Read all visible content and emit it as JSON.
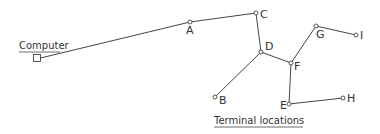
{
  "diagram": {
    "type": "network-tree",
    "computer": {
      "label": "Computer",
      "x": 37,
      "y": 58
    },
    "caption": {
      "label": "Terminal locations",
      "x": 214,
      "y": 127
    },
    "nodes": [
      {
        "id": "A",
        "label": "A",
        "x": 190,
        "y": 22,
        "lx": 186,
        "ly": 34
      },
      {
        "id": "C",
        "label": "C",
        "x": 256,
        "y": 13,
        "lx": 260,
        "ly": 18
      },
      {
        "id": "D",
        "label": "D",
        "x": 261,
        "y": 52,
        "lx": 265,
        "ly": 50
      },
      {
        "id": "B",
        "label": "B",
        "x": 215,
        "y": 97,
        "lx": 219,
        "ly": 104
      },
      {
        "id": "F",
        "label": "F",
        "x": 291,
        "y": 63,
        "lx": 294,
        "ly": 70
      },
      {
        "id": "G",
        "label": "G",
        "x": 316,
        "y": 26,
        "lx": 316,
        "ly": 38
      },
      {
        "id": "I",
        "label": "I",
        "x": 356,
        "y": 35,
        "lx": 360,
        "ly": 39
      },
      {
        "id": "E",
        "label": "E",
        "x": 289,
        "y": 104,
        "lx": 280,
        "ly": 109
      },
      {
        "id": "H",
        "label": "H",
        "x": 343,
        "y": 98,
        "lx": 347,
        "ly": 102
      }
    ],
    "edges": [
      [
        "Computer",
        "A"
      ],
      [
        "A",
        "C"
      ],
      [
        "C",
        "D"
      ],
      [
        "D",
        "B"
      ],
      [
        "D",
        "F"
      ],
      [
        "F",
        "G"
      ],
      [
        "G",
        "I"
      ],
      [
        "F",
        "E"
      ],
      [
        "E",
        "H"
      ]
    ]
  }
}
